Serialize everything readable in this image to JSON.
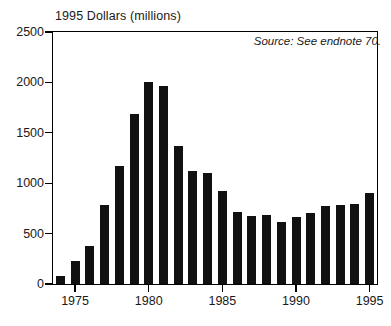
{
  "chart_data": {
    "type": "bar",
    "title": "1995 Dollars (millions)",
    "xlabel": "",
    "ylabel": "1995 Dollars (millions)",
    "annotation": "Source: See endnote 70.",
    "grid": false,
    "legend": false,
    "ylim": [
      0,
      2500
    ],
    "ytick_labels": [
      "2500",
      "2000",
      "1500",
      "1000",
      "500",
      "0"
    ],
    "yticks": [
      2500,
      2000,
      1500,
      1000,
      500,
      0
    ],
    "xtick_labels": [
      "1975",
      "1980",
      "1985",
      "1990",
      "1995"
    ],
    "xticks": [
      1975,
      1980,
      1985,
      1990,
      1995
    ],
    "categories": [
      "1974",
      "1975",
      "1976",
      "1977",
      "1978",
      "1979",
      "1980",
      "1981",
      "1982",
      "1983",
      "1984",
      "1985",
      "1986",
      "1987",
      "1988",
      "1989",
      "1990",
      "1991",
      "1992",
      "1993",
      "1994",
      "1995"
    ],
    "values": [
      75,
      225,
      380,
      780,
      1175,
      1690,
      2000,
      1965,
      1365,
      1120,
      1105,
      920,
      715,
      670,
      680,
      620,
      665,
      700,
      770,
      780,
      795,
      900
    ],
    "bar_color": "#111111"
  },
  "axis": {
    "y_labels": [
      "2500",
      "2000",
      "1500",
      "1000",
      "500",
      "0"
    ],
    "x_labels": [
      "1975",
      "1980",
      "1985",
      "1990",
      "1995"
    ]
  },
  "notes": {
    "source": "Source: See endnote 70."
  },
  "header": {
    "title": "1995 Dollars (millions)"
  }
}
